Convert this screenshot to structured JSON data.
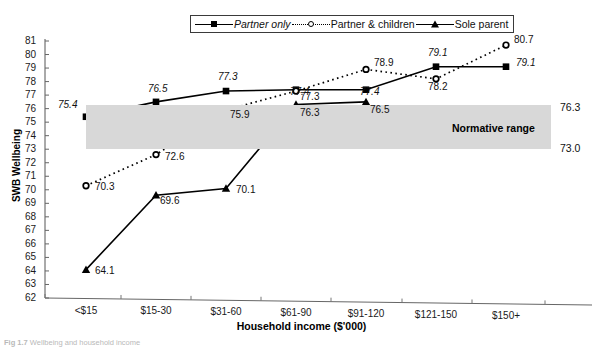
{
  "chart_data": {
    "type": "line",
    "title": "",
    "xlabel": "Household income ($'000)",
    "ylabel": "SWB Wellbeing",
    "categories": [
      "<$15",
      "$15-30",
      "$31-60",
      "$61-90",
      "$91-120",
      "$121-150",
      "$150+"
    ],
    "ylim": [
      62,
      81
    ],
    "yticks": [
      81,
      80,
      79,
      78,
      77,
      76,
      75,
      74,
      73,
      72,
      71,
      70,
      69,
      68,
      67,
      66,
      65,
      64,
      63,
      62
    ],
    "grid": false,
    "legend_position": "top-center",
    "series": [
      {
        "name": "Partner only",
        "marker": "square",
        "line": "solid",
        "values": [
          75.4,
          76.5,
          77.3,
          77.4,
          77.4,
          79.1,
          79.1
        ],
        "labels": [
          "75.4",
          "76.5",
          "77.3",
          "77.4",
          "77.4",
          "79.1",
          "79.1"
        ]
      },
      {
        "name": "Partner & children",
        "marker": "circle",
        "line": "dotted",
        "values": [
          70.3,
          72.6,
          75.9,
          77.3,
          78.9,
          78.2,
          80.7
        ],
        "labels": [
          "70.3",
          "72.6",
          "75.9",
          "77.3",
          "78.9",
          "78.2",
          "80.7"
        ]
      },
      {
        "name": "Sole parent",
        "marker": "triangle",
        "line": "solid",
        "values": [
          64.1,
          69.6,
          70.1,
          76.3,
          76.5,
          null,
          null
        ],
        "labels": [
          "64.1",
          "69.6",
          "70.1",
          "76.3",
          "76.5",
          "",
          ""
        ]
      }
    ],
    "annotations": {
      "normative_range": {
        "label": "Normative range",
        "upper": 76.3,
        "lower": 73.0,
        "upper_text": "76.3",
        "lower_text": "73.0",
        "color": "#d8d8d8"
      }
    }
  },
  "legend": {
    "items": [
      {
        "label": "Partner only",
        "marker": "square-marker-icon",
        "style": "solid"
      },
      {
        "label": "Partner & children",
        "marker": "circle-marker-icon",
        "style": "dotted"
      },
      {
        "label": "Sole parent",
        "marker": "triangle-marker-icon",
        "style": "solid"
      }
    ]
  },
  "caption": {
    "prefix": "Fig 1.7",
    "text": "Wellbeing and household income"
  },
  "colors": {
    "band": "#d8d8d8",
    "line": "#000000",
    "axis": "#555555",
    "text": "#111111"
  }
}
